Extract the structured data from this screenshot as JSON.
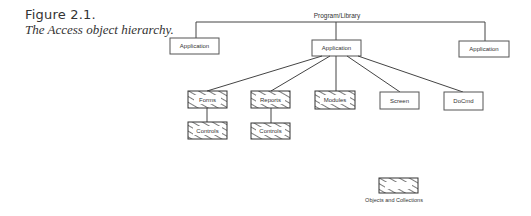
{
  "figure": {
    "number": "Figure 2.1.",
    "caption": "The Access object hierarchy."
  },
  "diagram": {
    "root_label": "Program/Library",
    "applications": [
      {
        "label": "Application"
      },
      {
        "label": "Application"
      },
      {
        "label": "Application"
      }
    ],
    "children": [
      {
        "label": "Forms",
        "type": "collection"
      },
      {
        "label": "Reports",
        "type": "collection"
      },
      {
        "label": "Modules",
        "type": "collection"
      },
      {
        "label": "Screen",
        "type": "object"
      },
      {
        "label": "DoCmd",
        "type": "object"
      }
    ],
    "grandchildren": [
      {
        "label": "Controls",
        "type": "collection",
        "parent": "Forms"
      },
      {
        "label": "Controls",
        "type": "collection",
        "parent": "Reports"
      }
    ],
    "legend": {
      "label": "Objects and Collections"
    }
  }
}
